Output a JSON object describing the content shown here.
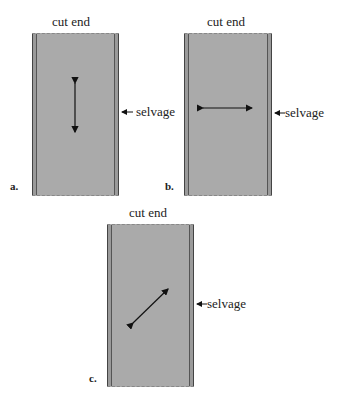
{
  "figure": {
    "panels": [
      {
        "letter": "a.",
        "top_label": "cut end",
        "side_label": "selvage",
        "grain_direction": "vertical"
      },
      {
        "letter": "b.",
        "top_label": "cut end",
        "side_label": "selvage",
        "grain_direction": "horizontal"
      },
      {
        "letter": "c.",
        "top_label": "cut end",
        "side_label": "selvage",
        "grain_direction": "diagonal"
      }
    ],
    "colors": {
      "fabric": "#aaaaaa",
      "selvage_line": "#444444",
      "arrow": "#111111"
    }
  }
}
